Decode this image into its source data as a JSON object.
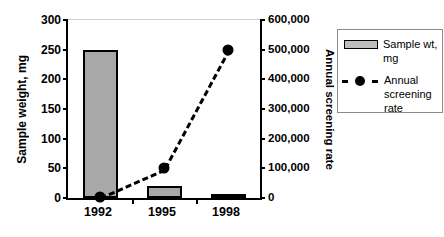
{
  "chart_data": {
    "type": "bar",
    "title": "",
    "subtitle": "",
    "categories": [
      "1992",
      "1995",
      "1998"
    ],
    "xlabel": "",
    "grid": false,
    "legend_position": "right",
    "axes": {
      "left": {
        "label": "Sample weight, mg",
        "ticks": [
          "0",
          "50",
          "100",
          "150",
          "200",
          "250",
          "300"
        ],
        "tick_values": [
          0,
          50,
          100,
          150,
          200,
          250,
          300
        ],
        "ylim": [
          0,
          300
        ]
      },
      "right": {
        "label": "Annual screening rate",
        "ticks": [
          "0",
          "100,000",
          "200,000",
          "300,000",
          "400,000",
          "500,000",
          "600,000"
        ],
        "tick_values": [
          0,
          100000,
          200000,
          300000,
          400000,
          500000,
          600000
        ],
        "ylim": [
          0,
          600000
        ]
      }
    },
    "series": [
      {
        "name": "Sample wt, mg",
        "type": "bar",
        "axis": "left",
        "color": "#a8a8a8",
        "edge_color": "#000000",
        "values": [
          250,
          20,
          2
        ]
      },
      {
        "name": "Annual screening rate",
        "type": "line",
        "axis": "right",
        "color": "#000000",
        "line_style": "dashed",
        "marker": "circle",
        "values": [
          5000,
          100000,
          500000
        ]
      }
    ]
  },
  "legend": {
    "entries": [
      {
        "label": "Sample wt, mg",
        "swatch": "bar-swatch"
      },
      {
        "label": "Annual screening rate",
        "swatch": "dashed-line-marker-swatch"
      }
    ]
  }
}
